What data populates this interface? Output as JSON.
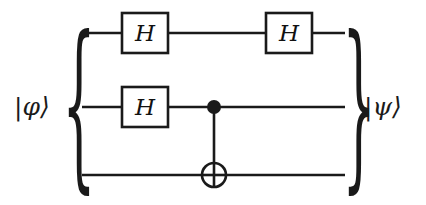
{
  "diagram": {
    "type": "quantum-circuit",
    "background_color": "#ffffff",
    "line_color": "#1a1a1a",
    "gate_fill_color": "#ffffff"
  },
  "labels": {
    "input_ket": "|φ⟩",
    "output_ket": "|ψ⟩",
    "left_brace": "{",
    "right_brace": "}"
  },
  "wires": [
    {
      "id": "q0",
      "name": "wire-qubit-0",
      "y": 33
    },
    {
      "id": "q1",
      "name": "wire-qubit-1",
      "y": 107
    },
    {
      "id": "q2",
      "name": "wire-qubit-2",
      "y": 175
    }
  ],
  "wire_extent": {
    "x_start": 82,
    "x_end": 345
  },
  "gates": [
    {
      "id": "h-q0-a",
      "name": "hadamard-gate",
      "label": "H",
      "wire": "q0",
      "x": 122,
      "y": 13,
      "width": 46,
      "height": 40
    },
    {
      "id": "h-q0-b",
      "name": "hadamard-gate",
      "label": "H",
      "wire": "q0",
      "x": 266,
      "y": 13,
      "width": 46,
      "height": 40
    },
    {
      "id": "h-q1",
      "name": "hadamard-gate",
      "label": "H",
      "wire": "q1",
      "x": 122,
      "y": 87,
      "width": 46,
      "height": 40
    }
  ],
  "cnot": {
    "id": "cnot-q1-q2",
    "name": "cnot-gate",
    "control_x": 214,
    "control_y": 107,
    "control_radius": 7,
    "target_x": 214,
    "target_y": 175,
    "target_radius": 12,
    "symbol": "⊕"
  }
}
